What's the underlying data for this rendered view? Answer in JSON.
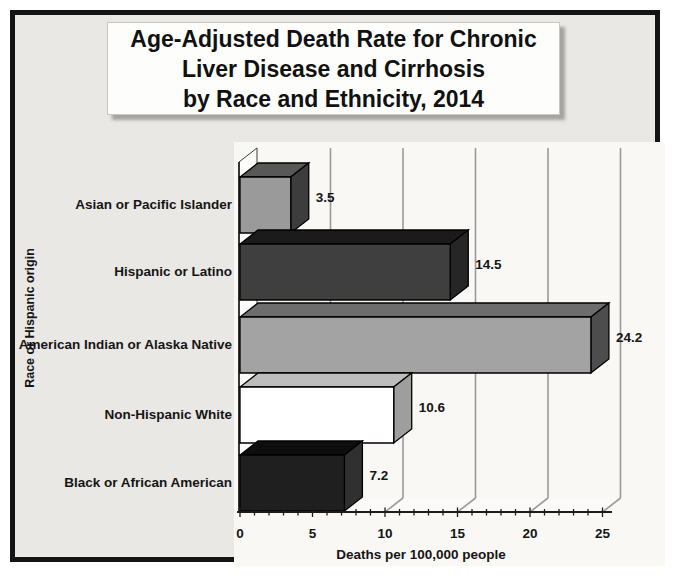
{
  "title": {
    "lines": [
      "Age-Adjusted Death Rate for Chronic",
      "Liver Disease and Cirrhosis",
      "by Race and Ethnicity, 2014"
    ]
  },
  "chart_data": {
    "type": "bar",
    "orientation": "horizontal",
    "effect": "3d",
    "title": "Age-Adjusted Death Rate for Chronic Liver Disease and Cirrhosis by Race and Ethnicity, 2014",
    "categories": [
      "Asian or Pacific Islander",
      "Hispanic or Latino",
      "American Indian or Alaska Native",
      "Non-Hispanic White",
      "Black or African American"
    ],
    "values": [
      3.5,
      14.5,
      24.2,
      10.6,
      7.2
    ],
    "value_labels": [
      "3.5",
      "14.5",
      "24.2",
      "10.6",
      "7.2"
    ],
    "xlabel": "Deaths per 100,000 people",
    "ylabel": "Race or Hispanic origin",
    "xlim": [
      0,
      25
    ],
    "xticks": [
      0,
      5,
      10,
      15,
      20,
      25
    ],
    "minor_tick_step": 1,
    "grid": true,
    "legend": "none",
    "bar_colors": [
      {
        "front": "#9a9a9a",
        "top": "#585858",
        "side": "#3d3d3d"
      },
      {
        "front": "#3f3f3f",
        "top": "#1b1b1b",
        "side": "#262626"
      },
      {
        "front": "#a3a3a3",
        "top": "#6d6d6d",
        "side": "#4d4d4d"
      },
      {
        "front": "#ffffff",
        "top": "#bdbdbd",
        "side": "#9e9e9e"
      },
      {
        "front": "#1f1f1f",
        "top": "#0e0e0e",
        "side": "#303030"
      }
    ],
    "gridline_color": "#9a9a9a",
    "axis_color": "#1c1c1c"
  }
}
